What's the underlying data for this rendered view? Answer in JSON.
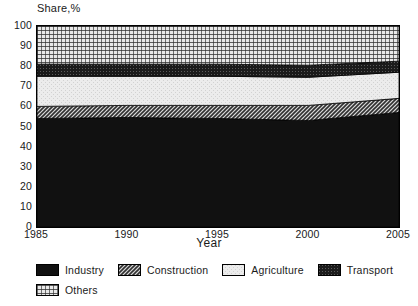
{
  "chart_data": {
    "type": "area",
    "title": "",
    "ylabel": "Share,%",
    "xlabel": "Year",
    "xlim": [
      1985,
      2005
    ],
    "ylim": [
      0,
      100
    ],
    "grid": false,
    "stacked": true,
    "legend_position": "bottom-left",
    "x": [
      1985,
      1990,
      1995,
      2000,
      2005
    ],
    "xticks": [
      "1985",
      "1990",
      "1995",
      "2000",
      "2005"
    ],
    "yticks": [
      "0",
      "10",
      "20",
      "30",
      "40",
      "50",
      "60",
      "70",
      "80",
      "90",
      "100"
    ],
    "series": [
      {
        "name": "Industry",
        "values": [
          54,
          54.5,
          54,
          53,
          57
        ],
        "fill": "solid-black",
        "color": "#111111"
      },
      {
        "name": "Construction",
        "values": [
          6,
          6,
          6.5,
          7.5,
          7
        ],
        "fill": "dark-hatch",
        "color": "#8a8a8a"
      },
      {
        "name": "Agriculture",
        "values": [
          15,
          14.5,
          14.5,
          14,
          13
        ],
        "fill": "light",
        "color": "#e2e2e2"
      },
      {
        "name": "Transport",
        "values": [
          6,
          6,
          6,
          6,
          5.5
        ],
        "fill": "dark-texture",
        "color": "#1f1f1f"
      },
      {
        "name": "Others",
        "values": [
          19,
          19,
          19,
          19.5,
          17.5
        ],
        "fill": "grid-hatch",
        "color": "#9a9a9a"
      }
    ],
    "cumulative_tops": {
      "Industry": [
        54,
        54.5,
        54,
        53,
        57
      ],
      "Construction": [
        60,
        60.5,
        60.5,
        60.5,
        64
      ],
      "Agriculture": [
        75,
        75,
        75,
        74.5,
        77
      ],
      "Transport": [
        81,
        81,
        81,
        80.5,
        82.5
      ],
      "Others": [
        100,
        100,
        100,
        100,
        100
      ]
    }
  },
  "legend": {
    "row1": [
      {
        "label": "Industry"
      },
      {
        "label": "Construction"
      },
      {
        "label": "Agriculture"
      },
      {
        "label": "Transport"
      }
    ],
    "row2": [
      {
        "label": "Others"
      }
    ]
  }
}
